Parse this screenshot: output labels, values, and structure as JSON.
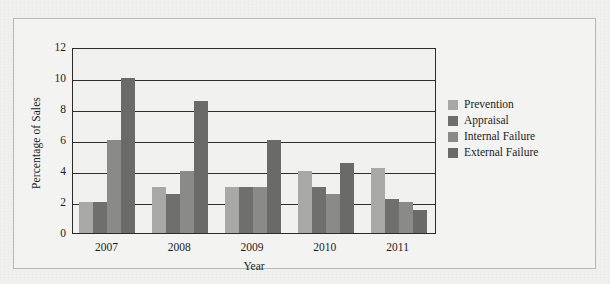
{
  "chart_data": {
    "type": "bar",
    "title": "",
    "xlabel": "Year",
    "ylabel": "Percentage of Sales",
    "categories": [
      "2007",
      "2008",
      "2009",
      "2010",
      "2011"
    ],
    "ylim": [
      0,
      12
    ],
    "yticks": [
      0,
      2,
      4,
      6,
      8,
      10,
      12
    ],
    "ytick_labels": [
      "0",
      "2",
      "4",
      "6",
      "8",
      "10",
      "12"
    ],
    "grid": true,
    "grid_axis": "y",
    "legend_position": "right",
    "series": [
      {
        "name": "Prevention",
        "color": "#a8a8a6",
        "values": [
          2.0,
          3.0,
          3.0,
          4.0,
          4.2
        ]
      },
      {
        "name": "Appraisal",
        "color": "#6f6f6d",
        "values": [
          2.0,
          2.5,
          3.0,
          3.0,
          2.2
        ]
      },
      {
        "name": "Internal Failure",
        "color": "#8a8a88",
        "values": [
          6.0,
          4.0,
          3.0,
          2.5,
          2.0
        ]
      },
      {
        "name": "External Failure",
        "color": "#6a6a68",
        "values": [
          10.0,
          8.5,
          6.0,
          4.5,
          1.5
        ]
      }
    ]
  },
  "colors": {
    "page_background": "#f1f1ef",
    "figure_border": "#b9b9b6",
    "axis": "#2c2c2c",
    "text": "#1d1d1d"
  }
}
